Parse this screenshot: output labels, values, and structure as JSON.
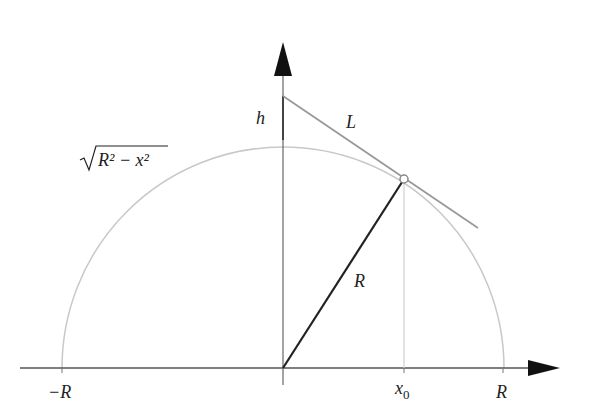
{
  "diagram": {
    "labels": {
      "h": "h",
      "L": "L",
      "radius": "R",
      "curve_radicand": "R² − x²",
      "neg_R": "−R",
      "pos_R": "R",
      "x0": "x",
      "x0_sub": "0"
    },
    "colors": {
      "axis": "#555555",
      "arrow": "#111111",
      "circle": "#c8c8c8",
      "tangent": "#999999",
      "radius_line": "#222222",
      "h_segment": "#555555",
      "dropline": "#d0d0d0",
      "text": "#222222"
    },
    "geometry": {
      "origin": [
        283,
        368
      ],
      "radius_px": 221,
      "point_x0": [
        404,
        179
      ],
      "h_point": [
        283,
        96
      ],
      "tangent_end": [
        478,
        228
      ]
    }
  }
}
